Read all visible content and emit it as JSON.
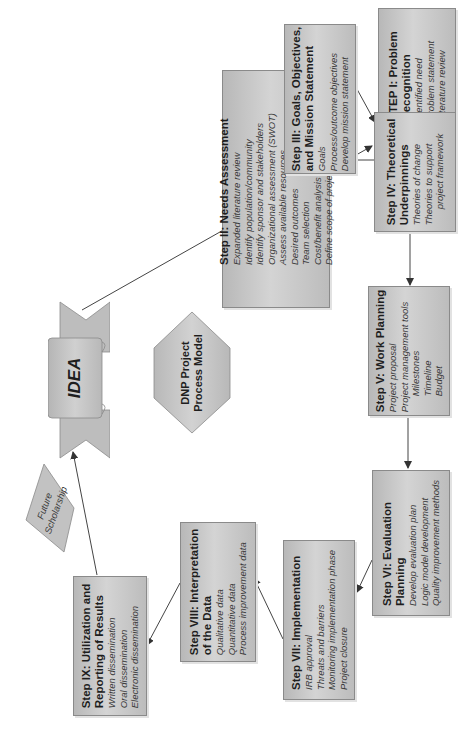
{
  "diagram": {
    "title": "DNP Project Process Model",
    "center_label_line1": "DNP Project",
    "center_label_line2": "Process Model",
    "idea_label": "IDEA",
    "future_line1": "Future",
    "future_line2": "Scholarship",
    "colors": {
      "box_fill": "#c6c6c6",
      "box_border": "#8a8a8a",
      "arrow": "#333333",
      "text": "#2a2a2a"
    },
    "steps": [
      {
        "id": "step1",
        "title_lines": [
          "STEP I: Problem",
          "Recognition"
        ],
        "items": [
          "Identified need",
          "Problem statement",
          "Literature review"
        ]
      },
      {
        "id": "step2",
        "title_lines": [
          "Step II: Needs Assessment"
        ],
        "items": [
          "Expanded literature review",
          "Identify population/community",
          "Identify sponsor and stakeholders",
          "Organizational assessment (SWOT)",
          "Assess available resources",
          "Desired outcomes",
          "Team selection",
          "Cost/benefit analysis",
          "Define scope of project"
        ]
      },
      {
        "id": "step3",
        "title_lines": [
          "Step III: Goals, Objectives,",
          "and Mission Statement"
        ],
        "items": [
          "Goals",
          "Process/outcome objectives",
          "Develop mission statement"
        ]
      },
      {
        "id": "step4",
        "title_lines": [
          "Step IV: Theoretical",
          "Underpinnings"
        ],
        "items": [
          "Theories of change",
          "Theories to support",
          "project framework"
        ]
      },
      {
        "id": "step5",
        "title_lines": [
          "Step V: Work Planning"
        ],
        "items": [
          "Project proposal",
          "Project management tools",
          "Milestones",
          "Timeline",
          "Budget"
        ]
      },
      {
        "id": "step6",
        "title_lines": [
          "Step VI: Evaluation",
          "Planning"
        ],
        "items": [
          "Develop evaluation plan",
          "Logic model development",
          "Quality improvement methods"
        ]
      },
      {
        "id": "step7",
        "title_lines": [
          "Step VII: Implementation"
        ],
        "items": [
          "IRB approval",
          "Threats and barriers",
          "Monitoring implementation phase",
          "Project closure"
        ]
      },
      {
        "id": "step8",
        "title_lines": [
          "Step VIII: Interpretation",
          "of the Data"
        ],
        "items": [
          "Qualitative data",
          "Quantitative data",
          "Process improvement data"
        ]
      },
      {
        "id": "step9",
        "title_lines": [
          "Step IX: Utilization and",
          "Reporting of Results"
        ],
        "items": [
          "Written dissemination",
          "Oral dissemination",
          "Electronic dissemination"
        ]
      }
    ]
  }
}
